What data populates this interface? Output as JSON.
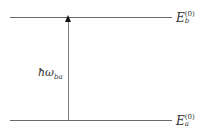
{
  "diagram": {
    "type": "energy-level-diagram",
    "levels": [
      {
        "id": "upper",
        "symbol": "E",
        "subscript": "b",
        "superscript": "(0)"
      },
      {
        "id": "lower",
        "symbol": "E",
        "subscript": "a",
        "superscript": "(0)"
      }
    ],
    "transition": {
      "from": "lower",
      "to": "upper",
      "label_main": "ħω",
      "label_sub": "ba"
    },
    "colors": {
      "line": "#6a6a6a",
      "arrowhead": "#111111",
      "text": "#333333"
    }
  }
}
